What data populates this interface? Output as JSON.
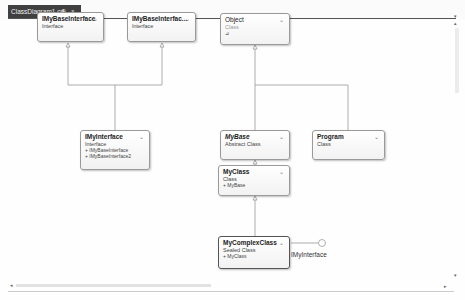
{
  "tab": {
    "label": "ClassDiagram1.cd",
    "pin_glyph": "⊕",
    "close_glyph": "×"
  },
  "dropdown_glyph": "▾",
  "boxes": {
    "imybaseinterface": {
      "title": "IMyBaseInterface",
      "kind": "Interface"
    },
    "imybaseinterface2": {
      "title": "IMyBaseInterfac...",
      "kind": "Interface"
    },
    "object": {
      "title": "Object",
      "kind": "Class",
      "extra": "⊿"
    },
    "imyinterface": {
      "title": "IMyInterface",
      "kind": "Interface",
      "members": [
        "+ IMyBaseInterface",
        "+ IMyBaseInterface2"
      ]
    },
    "mybase": {
      "title": "MyBase",
      "kind": "Abstract Class"
    },
    "program": {
      "title": "Program",
      "kind": "Class"
    },
    "myclass": {
      "title": "MyClass",
      "kind": "Class",
      "members": [
        "+ MyBase"
      ]
    },
    "mycomplexclass": {
      "title": "MyComplexClass",
      "kind": "Sealed Class",
      "members": [
        "+ MyClass"
      ]
    }
  },
  "chevron_glyph": "❯",
  "lollipop": {
    "label": "IMyInterface"
  },
  "scroll": {
    "left": "◂",
    "right": "▸",
    "up": "▴",
    "down": "▾"
  }
}
